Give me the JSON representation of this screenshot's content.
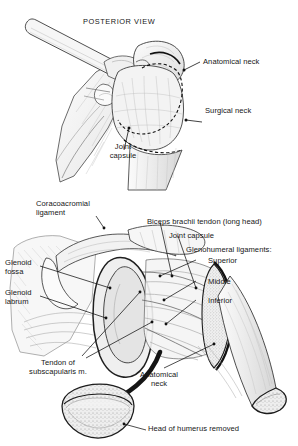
{
  "figure": {
    "background": "#ffffff",
    "ink": "#1a1a1a",
    "bone_fill": "#efefef",
    "bone_light": "#f7f7f7",
    "bone_shadow": "#d9d9d9",
    "width": 298,
    "height": 446
  },
  "panels": [
    {
      "id": "posterior-view",
      "title": "POSTERIOR VIEW",
      "labels": [
        {
          "id": "anatomical-neck",
          "text": "Anatomical neck"
        },
        {
          "id": "surgical-neck",
          "text": "Surgical neck"
        },
        {
          "id": "joint-capsule",
          "text": "Joint\ncapsule"
        }
      ]
    },
    {
      "id": "opened-joint-view",
      "title": "",
      "labels": [
        {
          "id": "coracoacromial-ligament",
          "text": "Coracoacromial\nligament"
        },
        {
          "id": "glenoid-fossa",
          "text": "Glenoid\nfossa"
        },
        {
          "id": "glenoid-labrum",
          "text": "Glenoid\nlabrum"
        },
        {
          "id": "biceps-brachii-tendon",
          "text": "Biceps brachii tendon (long head)"
        },
        {
          "id": "joint-capsule",
          "text": "Joint capsule"
        },
        {
          "id": "glenohumeral-ligaments",
          "text": "Glenohumeral ligaments:"
        },
        {
          "id": "gh-superior",
          "text": "Superior"
        },
        {
          "id": "gh-middle",
          "text": "Middle"
        },
        {
          "id": "gh-inferior",
          "text": "Inferior"
        },
        {
          "id": "tendon-of-subscapularis",
          "text": "Tendon of\nsubscapularis m."
        },
        {
          "id": "anatomical-neck",
          "text": "Anatomical\nneck"
        },
        {
          "id": "head-of-humerus-removed",
          "text": "Head of humerus removed"
        }
      ]
    }
  ]
}
